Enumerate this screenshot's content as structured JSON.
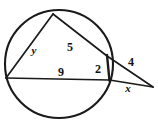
{
  "figure": {
    "kind": "circle-two-secants-from-external-point",
    "canvas": {
      "width": 158,
      "height": 122,
      "background": "#ffffff"
    },
    "stroke_color": "#1a1a1a",
    "label_color": "#111111",
    "circle": {
      "cx": 59,
      "cy": 64,
      "r": 54
    },
    "points": {
      "top_on_circle": {
        "x": 53,
        "y": 14
      },
      "left_on_circle": {
        "x": 6,
        "y": 78
      },
      "upper_secant_exit": {
        "x": 107,
        "y": 56
      },
      "lower_secant_exit": {
        "x": 109.5,
        "y": 80
      },
      "external_vertex": {
        "x": 153,
        "y": 87
      }
    },
    "labels": [
      {
        "id": "label-y",
        "text": "y",
        "x": 34,
        "y": 50,
        "italic": true
      },
      {
        "id": "label-5",
        "text": "5",
        "x": 70,
        "y": 47,
        "italic": false
      },
      {
        "id": "label-9",
        "text": "9",
        "x": 61,
        "y": 72,
        "italic": false
      },
      {
        "id": "label-2",
        "text": "2",
        "x": 98,
        "y": 69,
        "italic": false
      },
      {
        "id": "label-4",
        "text": "4",
        "x": 131,
        "y": 62,
        "italic": false
      },
      {
        "id": "label-x",
        "text": "x",
        "x": 128,
        "y": 88,
        "italic": true
      }
    ]
  }
}
